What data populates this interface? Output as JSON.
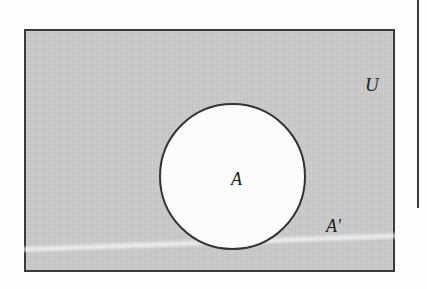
{
  "figure": {
    "kind": "venn-diagram",
    "width": 427,
    "height": 289
  },
  "labels": {
    "universe": "U",
    "set_a": "A",
    "set_a_complement_letter": "A",
    "set_a_complement_prime": "′",
    "set_a_complement": "A′"
  },
  "regions": {
    "universe_rect": {
      "name": "universal-set-region",
      "fill": "#cbcbcb",
      "stroke": "#3a3a3a",
      "x": 24,
      "y": 29,
      "width": 371,
      "height": 243
    },
    "set_a_circle": {
      "name": "set-a-region",
      "fill": "#fcfcfc",
      "stroke": "#343434",
      "cx": 206,
      "cy": 146,
      "diameter": 147
    }
  },
  "colors": {
    "page_background": "#ffffff",
    "shaded_complement": "#cbcbcb",
    "set_interior": "#fcfcfc",
    "ink": "#343434",
    "label_text": "#1d1d1d",
    "gutter_rule": "#3c3c3c"
  },
  "artifacts": {
    "scan_streak": "faint light diagonal scanner streak across lower area",
    "gutter_rule": "vertical page rule at right edge"
  }
}
